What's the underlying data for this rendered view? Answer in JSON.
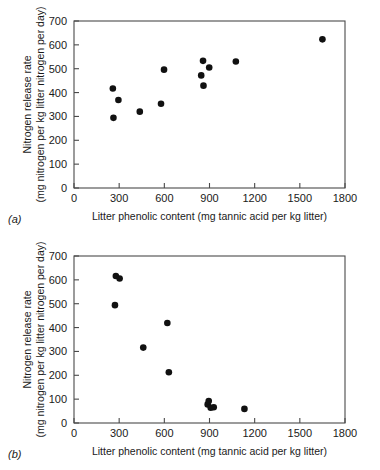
{
  "figure": {
    "panels": [
      {
        "tag": "(a)",
        "xlabel": "Litter phenolic content (mg tannic acid per kg litter)",
        "ylabel_line1": "Nitrogen release rate",
        "ylabel_line2": "(mg nitrogen per kg litter nitrogen per day)"
      },
      {
        "tag": "(b)",
        "xlabel": "Litter phenolic content (mg tannic acid per kg litter)",
        "ylabel_line1": "Nitrogen release rate",
        "ylabel_line2": "(mg nitrogen per kg litter nitrogen per day)"
      }
    ]
  },
  "chart_data": [
    {
      "type": "scatter",
      "title": "(a)",
      "xlabel": "Litter phenolic content (mg tannic acid per kg litter)",
      "ylabel": "Nitrogen release rate (mg nitrogen per kg litter nitrogen per day)",
      "xlim": [
        0,
        1800
      ],
      "ylim": [
        0,
        700
      ],
      "xticks": [
        0,
        300,
        600,
        900,
        1200,
        1500,
        1800
      ],
      "yticks": [
        0,
        100,
        200,
        300,
        400,
        500,
        600,
        700
      ],
      "grid": false,
      "legend": "none",
      "marker": "filled-circle",
      "marker_color": "#111111",
      "trend": "positive",
      "points": [
        {
          "x": 258,
          "y": 417
        },
        {
          "x": 262,
          "y": 294
        },
        {
          "x": 295,
          "y": 369
        },
        {
          "x": 437,
          "y": 320
        },
        {
          "x": 578,
          "y": 353
        },
        {
          "x": 598,
          "y": 496
        },
        {
          "x": 845,
          "y": 472
        },
        {
          "x": 857,
          "y": 533
        },
        {
          "x": 860,
          "y": 429
        },
        {
          "x": 898,
          "y": 505
        },
        {
          "x": 1075,
          "y": 530
        },
        {
          "x": 1650,
          "y": 623
        }
      ]
    },
    {
      "type": "scatter",
      "title": "(b)",
      "xlabel": "Litter phenolic content (mg tannic acid per kg litter)",
      "ylabel": "Nitrogen release rate (mg nitrogen per kg litter nitrogen per day)",
      "xlim": [
        0,
        1800
      ],
      "ylim": [
        0,
        700
      ],
      "xticks": [
        0,
        300,
        600,
        900,
        1200,
        1500,
        1800
      ],
      "yticks": [
        0,
        100,
        200,
        300,
        400,
        500,
        600,
        700
      ],
      "grid": false,
      "legend": "none",
      "marker": "filled-circle",
      "marker_color": "#111111",
      "trend": "negative",
      "points": [
        {
          "x": 278,
          "y": 616
        },
        {
          "x": 303,
          "y": 606
        },
        {
          "x": 272,
          "y": 494
        },
        {
          "x": 460,
          "y": 316
        },
        {
          "x": 620,
          "y": 419
        },
        {
          "x": 630,
          "y": 213
        },
        {
          "x": 888,
          "y": 78
        },
        {
          "x": 895,
          "y": 92
        },
        {
          "x": 908,
          "y": 64
        },
        {
          "x": 928,
          "y": 66
        },
        {
          "x": 1132,
          "y": 59
        }
      ]
    }
  ]
}
